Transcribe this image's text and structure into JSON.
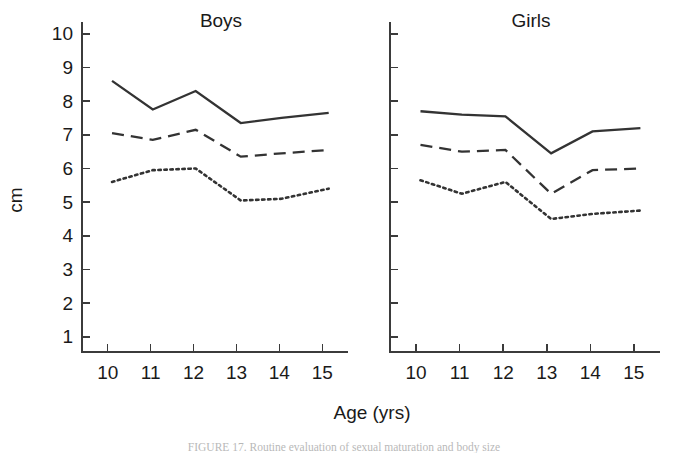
{
  "figure": {
    "axis_title_x": "Age (yrs)",
    "axis_title_y": "cm",
    "caption": "FIGURE 17. Routine evaluation of sexual maturation and body size"
  },
  "panels": {
    "boys": {
      "title": "Boys"
    },
    "girls": {
      "title": "Girls"
    }
  },
  "chart_data": {
    "type": "line",
    "title": "",
    "xlabel": "Age (yrs)",
    "ylabel": "cm",
    "xlim": [
      9.4,
      15.6
    ],
    "ylim": [
      0.55,
      10.35
    ],
    "grid": false,
    "legend": "none",
    "x_ticks": [
      10,
      11,
      12,
      13,
      14,
      15
    ],
    "y_ticks": [
      1,
      2,
      3,
      4,
      5,
      6,
      7,
      8,
      9,
      10
    ],
    "x_tick_labels": [
      "10",
      "11",
      "12",
      "13",
      "14",
      "15"
    ],
    "y_tick_labels": [
      "1",
      "2",
      "3",
      "4",
      "5",
      "6",
      "7",
      "8",
      "9",
      "10"
    ],
    "panels": [
      {
        "name": "Boys",
        "x": [
          10.1,
          11.05,
          12.05,
          13.1,
          14.05,
          15.15
        ],
        "series": [
          {
            "name": "upper",
            "style": "solid",
            "values": [
              8.6,
              7.75,
              8.3,
              7.35,
              7.5,
              7.65
            ]
          },
          {
            "name": "middle",
            "style": "dashed",
            "values": [
              7.05,
              6.85,
              7.15,
              6.35,
              6.45,
              6.55
            ]
          },
          {
            "name": "lower",
            "style": "dotted",
            "values": [
              5.6,
              5.95,
              6.0,
              5.05,
              5.1,
              5.4
            ]
          }
        ]
      },
      {
        "name": "Girls",
        "x": [
          10.1,
          11.05,
          12.05,
          13.1,
          14.05,
          15.15
        ],
        "series": [
          {
            "name": "upper",
            "style": "solid",
            "values": [
              7.7,
              7.6,
              7.55,
              6.45,
              7.1,
              7.2
            ]
          },
          {
            "name": "middle",
            "style": "dashed",
            "values": [
              6.7,
              6.5,
              6.55,
              5.25,
              5.95,
              6.0
            ]
          },
          {
            "name": "lower",
            "style": "dotted",
            "values": [
              5.65,
              5.25,
              5.6,
              4.5,
              4.65,
              4.75
            ]
          }
        ]
      }
    ]
  }
}
